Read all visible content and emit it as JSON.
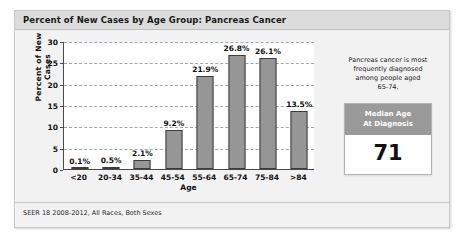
{
  "card": {
    "title": "Percent of New Cases by Age Group: Pancreas Cancer",
    "footer": "SEER 18 2008-2012, All Races, Both Sexes"
  },
  "sidebar": {
    "note_line_1": "Pancreas cancer is most",
    "note_line_2": "frequently diagnosed",
    "note_line_3": "among people aged",
    "note_line_4": "65-74.",
    "median_header_line_1": "Median Age",
    "median_header_line_2": "At Diagnosis",
    "median_value": "71"
  },
  "chart_data": {
    "type": "bar",
    "title": "Percent of New Cases by Age Group: Pancreas Cancer",
    "xlabel": "Age",
    "ylabel": "Percent of New Cases",
    "categories": [
      "<20",
      "20-34",
      "35-44",
      "45-54",
      "55-64",
      "65-74",
      "75-84",
      ">84"
    ],
    "values": [
      0.1,
      0.5,
      2.1,
      9.2,
      21.9,
      26.8,
      26.1,
      13.5
    ],
    "data_labels": [
      "0.1%",
      "0.5%",
      "2.1%",
      "9.2%",
      "21.9%",
      "26.8%",
      "26.1%",
      "13.5%"
    ],
    "ylim": [
      0,
      30
    ],
    "yticks": [
      0,
      5,
      10,
      15,
      20,
      25,
      30
    ],
    "ytick_labels": [
      "0",
      "5",
      "10",
      "15",
      "20",
      "25",
      "30"
    ],
    "grid": "horizontal-dashed",
    "legend": "none",
    "bar_color": "#969696",
    "bar_edge_color": "#3c3c3c",
    "gridline_color": "#9aa8b5"
  }
}
